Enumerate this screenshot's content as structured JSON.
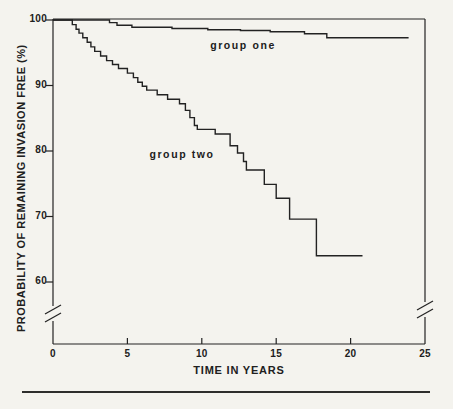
{
  "figure": {
    "background_color": "#f4f3ee",
    "ink_color": "#222222"
  },
  "chart_data": {
    "type": "line",
    "subtype": "kaplan-meier step survival curves",
    "title": "",
    "xlabel": "TIME IN YEARS",
    "ylabel": "PROBABILITY OF REMAINING INVASION FREE (%)",
    "xlim": [
      0,
      25
    ],
    "ylim": [
      60,
      100
    ],
    "x_ticks": [
      0,
      5,
      10,
      15,
      20,
      25
    ],
    "y_ticks": [
      100,
      90,
      80,
      70,
      60
    ],
    "grid": false,
    "frame": "full box",
    "y_axis_break": true,
    "legend_position": "inline labels",
    "series": [
      {
        "name": "group one",
        "label_anchor": {
          "x": 12.7,
          "y": 96.2
        },
        "points": [
          [
            0,
            100
          ],
          [
            3.8,
            100
          ],
          [
            3.8,
            99.6
          ],
          [
            4.3,
            99.6
          ],
          [
            4.3,
            99.2
          ],
          [
            5.3,
            99.2
          ],
          [
            5.3,
            98.9
          ],
          [
            8.0,
            98.9
          ],
          [
            8.0,
            98.7
          ],
          [
            10.4,
            98.7
          ],
          [
            10.4,
            98.5
          ],
          [
            12.6,
            98.5
          ],
          [
            12.6,
            98.4
          ],
          [
            14.6,
            98.4
          ],
          [
            14.6,
            98.2
          ],
          [
            16.9,
            98.2
          ],
          [
            16.9,
            97.9
          ],
          [
            18.4,
            97.9
          ],
          [
            18.4,
            97.3
          ],
          [
            23.9,
            97.3
          ]
        ]
      },
      {
        "name": "group two",
        "label_anchor": {
          "x": 8.7,
          "y": 79.5
        },
        "points": [
          [
            0,
            100
          ],
          [
            1.3,
            100
          ],
          [
            1.3,
            99.3
          ],
          [
            1.55,
            99.3
          ],
          [
            1.55,
            98.6
          ],
          [
            1.75,
            98.6
          ],
          [
            1.75,
            98.0
          ],
          [
            2.0,
            98.0
          ],
          [
            2.0,
            97.3
          ],
          [
            2.3,
            97.3
          ],
          [
            2.3,
            96.6
          ],
          [
            2.55,
            96.6
          ],
          [
            2.55,
            95.9
          ],
          [
            2.8,
            95.9
          ],
          [
            2.8,
            95.2
          ],
          [
            3.2,
            95.2
          ],
          [
            3.2,
            94.5
          ],
          [
            3.6,
            94.5
          ],
          [
            3.6,
            93.8
          ],
          [
            4.0,
            93.8
          ],
          [
            4.0,
            93.2
          ],
          [
            4.4,
            93.2
          ],
          [
            4.4,
            92.6
          ],
          [
            5.0,
            92.6
          ],
          [
            5.0,
            91.9
          ],
          [
            5.4,
            91.9
          ],
          [
            5.4,
            91.2
          ],
          [
            5.7,
            91.2
          ],
          [
            5.7,
            90.5
          ],
          [
            6.0,
            90.5
          ],
          [
            6.0,
            89.9
          ],
          [
            6.3,
            89.9
          ],
          [
            6.3,
            89.3
          ],
          [
            7.0,
            89.3
          ],
          [
            7.0,
            88.6
          ],
          [
            7.7,
            88.6
          ],
          [
            7.7,
            87.9
          ],
          [
            8.5,
            87.9
          ],
          [
            8.5,
            87.2
          ],
          [
            8.9,
            87.2
          ],
          [
            8.9,
            86.2
          ],
          [
            9.2,
            86.2
          ],
          [
            9.2,
            85.1
          ],
          [
            9.5,
            85.1
          ],
          [
            9.5,
            83.9
          ],
          [
            9.7,
            83.9
          ],
          [
            9.7,
            83.3
          ],
          [
            10.9,
            83.3
          ],
          [
            10.9,
            82.6
          ],
          [
            11.9,
            82.6
          ],
          [
            11.9,
            80.8
          ],
          [
            12.4,
            80.8
          ],
          [
            12.4,
            79.7
          ],
          [
            12.8,
            79.7
          ],
          [
            12.8,
            78.4
          ],
          [
            13.0,
            78.4
          ],
          [
            13.0,
            77.1
          ],
          [
            14.2,
            77.1
          ],
          [
            14.2,
            74.9
          ],
          [
            15.0,
            74.9
          ],
          [
            15.0,
            72.8
          ],
          [
            15.9,
            72.8
          ],
          [
            15.9,
            69.6
          ],
          [
            17.7,
            69.6
          ],
          [
            17.7,
            64.0
          ],
          [
            20.8,
            64.0
          ]
        ]
      }
    ]
  }
}
